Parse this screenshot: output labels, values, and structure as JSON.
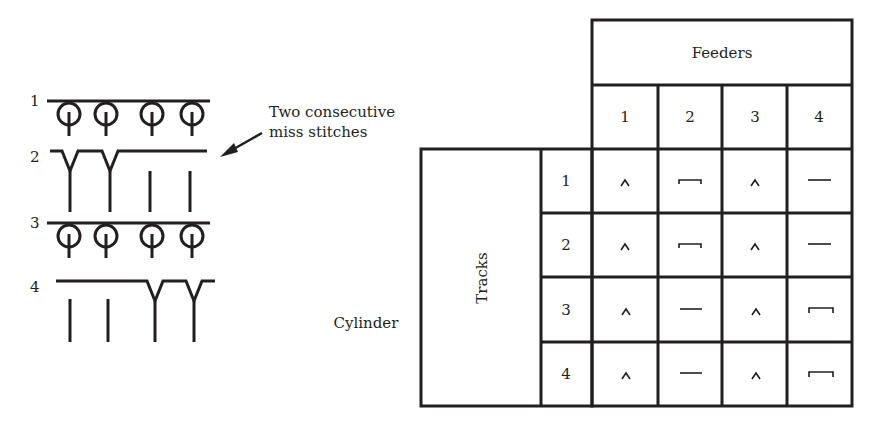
{
  "stitch_diagram": {
    "rows": [
      {
        "label": "1",
        "type": "tuck-loops",
        "needles": [
          "loop",
          "loop",
          "loop",
          "loop"
        ]
      },
      {
        "label": "2",
        "type": "miss",
        "needles": [
          "miss",
          "miss",
          "knit-stem",
          "knit-stem"
        ]
      },
      {
        "label": "3",
        "type": "tuck-loops",
        "needles": [
          "loop",
          "loop",
          "loop",
          "loop"
        ]
      },
      {
        "label": "4",
        "type": "miss",
        "needles": [
          "knit-stem",
          "knit-stem",
          "miss",
          "miss"
        ]
      }
    ],
    "annotation": {
      "line1": "Two consecutive",
      "line2": "miss stitches"
    }
  },
  "cam_table": {
    "feeders_header": "Feeders",
    "feeder_numbers": [
      "1",
      "2",
      "3",
      "4"
    ],
    "tracks_label": "Tracks",
    "cylinder_label": "Cylinder",
    "track_numbers": [
      "1",
      "2",
      "3",
      "4"
    ],
    "cells": [
      [
        "^",
        "⊓",
        "^",
        "—"
      ],
      [
        "^",
        "⊓",
        "^",
        "—"
      ],
      [
        "^",
        "—",
        "^",
        "⊓"
      ],
      [
        "^",
        "—",
        "^",
        "⊓"
      ]
    ],
    "cell_symbols_legend": {
      "^": "knit cam",
      "⊓": "tuck/knit raised",
      "—": "miss"
    }
  }
}
